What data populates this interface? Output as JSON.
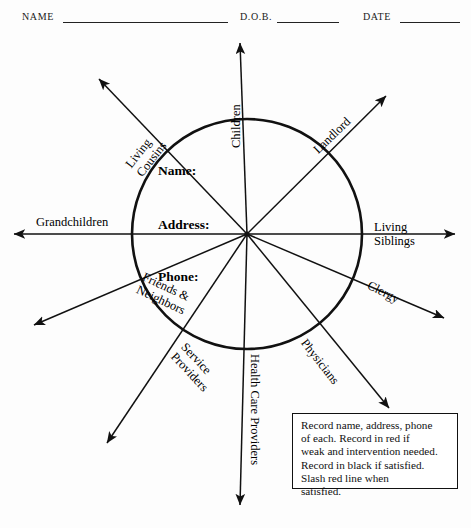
{
  "document": {
    "title": "Social Support Network Ecomap Worksheet"
  },
  "header": {
    "fields": [
      {
        "label": "NAME",
        "rule_x": 63,
        "rule_w": 165,
        "label_x": 22,
        "label_y": 19
      },
      {
        "label": "D.O.B.",
        "rule_x": 277,
        "rule_w": 62,
        "label_x": 240,
        "label_y": 19
      },
      {
        "label": "DATE",
        "rule_x": 400,
        "rule_w": 60,
        "label_x": 363,
        "label_y": 19
      }
    ]
  },
  "diagram": {
    "type": "ecomap",
    "center": {
      "x": 247,
      "y": 234
    },
    "circle_radius": 115,
    "center_fields": [
      {
        "label": "Name:",
        "x": 158,
        "y": 172
      },
      {
        "label": "Address:",
        "x": 158,
        "y": 226
      },
      {
        "label": "Phone:",
        "x": 158,
        "y": 278
      }
    ],
    "spokes": [
      {
        "name": "children",
        "label_lines": [
          "Children"
        ],
        "angle_deg": -90,
        "tip": {
          "x": 240,
          "y": 43
        },
        "label": {
          "x": 237,
          "y": 148,
          "rotate": -90,
          "align": "start"
        }
      },
      {
        "name": "landlord",
        "label_lines": [
          "Landlord"
        ],
        "angle_deg": -45,
        "tip": {
          "x": 386,
          "y": 96
        },
        "label": {
          "x": 316,
          "y": 152,
          "rotate": -44,
          "align": "start"
        }
      },
      {
        "name": "living-siblings",
        "label_lines": [
          "Living",
          "Siblings"
        ],
        "angle_deg": 0,
        "tip": {
          "x": 455,
          "y": 234
        },
        "label": {
          "x": 374,
          "y": 234,
          "rotate": 0,
          "align": "start"
        }
      },
      {
        "name": "clergy",
        "label_lines": [
          "Clergy"
        ],
        "angle_deg": 28,
        "tip": {
          "x": 444,
          "y": 318
        },
        "label": {
          "x": 368,
          "y": 285,
          "rotate": 27,
          "align": "start"
        }
      },
      {
        "name": "physicians",
        "label_lines": [
          "Physicians"
        ],
        "angle_deg": 53,
        "tip": {
          "x": 389,
          "y": 408
        },
        "label": {
          "x": 303,
          "y": 341,
          "rotate": 52,
          "align": "start"
        }
      },
      {
        "name": "health-care-providers",
        "label_lines": [
          "Health Care Providers"
        ],
        "angle_deg": 90,
        "tip": {
          "x": 240,
          "y": 505
        },
        "label": {
          "x": 254,
          "y": 354,
          "rotate": 90,
          "align": "start"
        }
      },
      {
        "name": "service-providers",
        "label_lines": [
          "Service",
          "Providers"
        ],
        "angle_deg": 126,
        "tip": {
          "x": 107,
          "y": 443
        },
        "label": {
          "x": 178,
          "y": 350,
          "rotate": 47,
          "align": "start"
        }
      },
      {
        "name": "friends-neighbors",
        "label_lines": [
          "Friends &",
          "Neighbors"
        ],
        "angle_deg": 155,
        "tip": {
          "x": 34,
          "y": 325
        },
        "label": {
          "x": 140,
          "y": 283,
          "rotate": 25,
          "align": "start"
        }
      },
      {
        "name": "grandchildren",
        "label_lines": [
          "Grandchildren"
        ],
        "angle_deg": 180,
        "tip": {
          "x": 14,
          "y": 234
        },
        "label": {
          "x": 36,
          "y": 223,
          "rotate": 0,
          "align": "start"
        }
      },
      {
        "name": "living-cousins",
        "label_lines": [
          "Living",
          "Cousins"
        ],
        "angle_deg": -128,
        "tip": {
          "x": 99,
          "y": 79
        },
        "label": {
          "x": 134,
          "y": 171,
          "rotate": -52,
          "align": "start"
        }
      }
    ]
  },
  "instructions": {
    "lines": [
      "Record name, address, phone",
      "of each. Record in red if",
      "weak and intervention needed.",
      "Record in black if satisfied.",
      "Slash red line when",
      "satisfied."
    ]
  },
  "colors": {
    "ink": "#111111",
    "paper": "#fdfdfd"
  }
}
